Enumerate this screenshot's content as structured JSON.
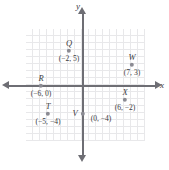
{
  "chart_data": {
    "type": "scatter",
    "title": "",
    "xlabel": "x",
    "ylabel": "y",
    "grid": true,
    "legend": "none",
    "xlim": [
      -8,
      9
    ],
    "ylim": [
      -7,
      7
    ],
    "origin_label": "",
    "points": [
      {
        "name": "Q",
        "x": -2,
        "y": 5,
        "coord": "(−2, 5)",
        "name_pos": "above",
        "coord_pos": "below"
      },
      {
        "name": "W",
        "x": 7,
        "y": 3,
        "coord": "(7, 3)",
        "name_pos": "above",
        "coord_pos": "below"
      },
      {
        "name": "R",
        "x": -6,
        "y": 0,
        "coord": "(−6, 0)",
        "name_pos": "above",
        "coord_pos": "below"
      },
      {
        "name": "T",
        "x": -5,
        "y": -4,
        "coord": "(−5, −4)",
        "name_pos": "above",
        "coord_pos": "below"
      },
      {
        "name": "V",
        "x": 0,
        "y": -4,
        "coord": "(0, −4)",
        "name_pos": "left",
        "coord_pos": "right"
      },
      {
        "name": "X",
        "x": 6,
        "y": -2,
        "coord": "(6, −2)",
        "name_pos": "above",
        "coord_pos": "below"
      }
    ]
  },
  "axes": {
    "x_label": "x",
    "y_label": "y",
    "arrow_right": "arrow-right",
    "arrow_left": "arrow-left",
    "arrow_up": "arrow-up",
    "arrow_down": "arrow-down"
  },
  "colors": {
    "grid": "#e8e8ea",
    "axis": "#6e6e74",
    "point": "#8b8b93",
    "text": "#3a3a40",
    "background": "#ffffff"
  }
}
